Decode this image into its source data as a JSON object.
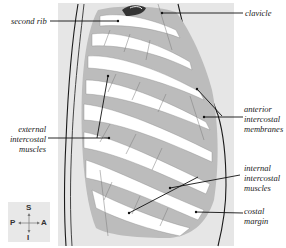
{
  "diagram": {
    "colors": {
      "panel_background": "#e6e6e6",
      "rib_fill": "#ffffff",
      "muscle_fill": "#b9b9b9",
      "outline": "#1a1a1a",
      "leader_line": "#111111"
    },
    "labels": {
      "second_rib": "second rib",
      "clavicle": "clavicle",
      "anterior_intercostal_membranes": [
        "anterior",
        "intercostal",
        "membranes"
      ],
      "external_intercostal_muscles": [
        "external",
        "intercostal",
        "muscles"
      ],
      "internal_intercostal_muscles": [
        "internal",
        "intercostal",
        "muscles"
      ],
      "costal_margin": [
        "costal",
        "margin"
      ]
    },
    "orientation_compass": {
      "superior": "S",
      "inferior": "I",
      "posterior": "P",
      "anterior": "A"
    }
  }
}
